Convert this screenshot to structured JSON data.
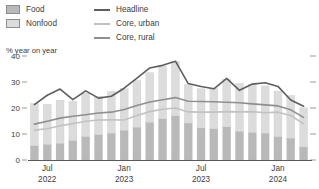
{
  "legend": {
    "items": [
      {
        "label": "Food",
        "type": "swatch",
        "color": "#b9b9b9",
        "name": "legend-food"
      },
      {
        "label": "Nonfood",
        "type": "swatch",
        "color": "#dcdcdc",
        "name": "legend-nonfood"
      },
      {
        "label": "Headline",
        "type": "line",
        "color": "#5e5e5e",
        "name": "legend-headline"
      },
      {
        "label": "Core, urban",
        "type": "line",
        "color": "#c2c2c2",
        "name": "legend-core-urban"
      },
      {
        "label": "Core, rural",
        "type": "line",
        "color": "#8f8f8f",
        "name": "legend-core-rural"
      }
    ]
  },
  "axis": {
    "y_title": "% year on year",
    "y_ticks": [
      "0",
      "10",
      "20",
      "30",
      "40"
    ],
    "x_ticks": [
      {
        "month": "Jul",
        "year": "2022"
      },
      {
        "month": "Jan",
        "year": "2023"
      },
      {
        "month": "Jul",
        "year": "2023"
      },
      {
        "month": "Jan",
        "year": "2024"
      }
    ]
  },
  "chart_data": {
    "type": "bar",
    "title": "",
    "subtitle": "",
    "xlabel": "",
    "ylabel": "% year on year",
    "ylim": [
      0,
      40
    ],
    "grid": false,
    "legend_position": "top-left",
    "stacked": true,
    "categories": [
      "Jun 2022",
      "Jul 2022",
      "Aug 2022",
      "Sep 2022",
      "Oct 2022",
      "Nov 2022",
      "Dec 2022",
      "Jan 2023",
      "Feb 2023",
      "Mar 2023",
      "Apr 2023",
      "May 2023",
      "Jun 2023",
      "Jul 2023",
      "Aug 2023",
      "Sep 2023",
      "Oct 2023",
      "Nov 2023",
      "Dec 2023",
      "Jan 2024",
      "Feb 2024",
      "Mar 2024"
    ],
    "x_tick_indices": [
      1,
      7,
      13,
      19
    ],
    "series": [
      {
        "name": "Food",
        "color": "#b9b9b9",
        "type": "bar",
        "values": [
          5.5,
          6.0,
          6.4,
          7.5,
          9.0,
          9.7,
          10.3,
          11.4,
          12.6,
          14.5,
          15.8,
          17.0,
          14.2,
          12.3,
          12.0,
          12.7,
          11.0,
          10.6,
          10.3,
          9.0,
          8.4,
          5.0
        ]
      },
      {
        "name": "Nonfood",
        "color": "#dcdcdc",
        "type": "bar",
        "values": [
          16.3,
          15.5,
          16.6,
          15.1,
          16.7,
          14.8,
          16.1,
          16.0,
          18.0,
          19.1,
          20.4,
          21.0,
          14.8,
          15.1,
          15.5,
          18.3,
          18.5,
          18.4,
          18.2,
          17.5,
          16.4,
          15.1
        ]
      }
    ],
    "lines": [
      {
        "name": "Headline",
        "color": "#5e5e5e",
        "width": 1.6,
        "values": [
          21.3,
          24.9,
          27.3,
          23.2,
          26.6,
          23.8,
          24.5,
          27.6,
          31.5,
          35.4,
          36.4,
          38.0,
          29.4,
          28.3,
          27.4,
          31.4,
          26.8,
          29.2,
          29.7,
          28.3,
          23.1,
          20.7
        ]
      },
      {
        "name": "Core, urban",
        "color": "#c2c2c2",
        "width": 1.6,
        "values": [
          11.5,
          12.0,
          13.2,
          14.0,
          14.9,
          15.4,
          15.5,
          15.4,
          17.1,
          18.6,
          19.5,
          20.0,
          18.5,
          18.4,
          18.4,
          18.6,
          18.5,
          18.6,
          18.2,
          18.4,
          17.1,
          13.9
        ]
      },
      {
        "name": "Core, rural",
        "color": "#8f8f8f",
        "width": 1.6,
        "values": [
          13.8,
          14.9,
          16.1,
          16.8,
          17.4,
          18.1,
          18.4,
          19.4,
          21.0,
          22.3,
          23.2,
          24.0,
          22.6,
          22.5,
          22.4,
          22.2,
          22.0,
          21.6,
          21.2,
          20.8,
          19.3,
          16.4
        ]
      }
    ]
  }
}
